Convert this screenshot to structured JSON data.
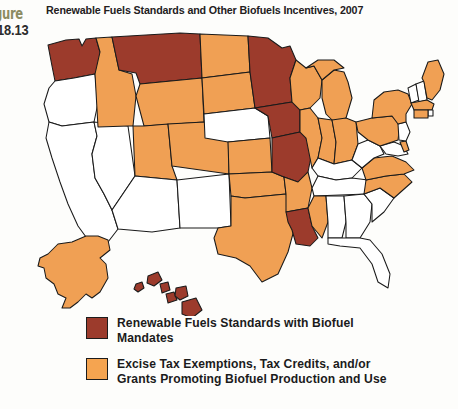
{
  "figure": {
    "label_word": "gure",
    "label_number": "18.13",
    "title": "Renewable Fuels Standards and Other Biofuels Incentives, 2007"
  },
  "colors": {
    "mandate_red": "#9c3b2c",
    "incentive_orange": "#f0a054",
    "no_policy_white": "#ffffff",
    "border": "#1a1a1a",
    "figure_tag": "#8c8c62",
    "background": "#fdfdfb"
  },
  "legend": {
    "items": [
      {
        "swatch": "mandate-red-swatch",
        "color": "#9c3b2c",
        "line1": "Renewable Fuels Standards with Biofuel",
        "line2": "Mandates"
      },
      {
        "swatch": "incentive-orange-swatch",
        "color": "#f5a450",
        "line1": "Excise Tax Exemptions, Tax Credits, and/or",
        "line2": "Grants Promoting Biofuel Production and Use"
      }
    ]
  },
  "map": {
    "type": "choropleth",
    "region": "United States",
    "categories": [
      "Renewable Fuels Standards with Biofuel Mandates",
      "Excise Tax Exemptions, Tax Credits, and/or Grants Promoting Biofuel Production and Use",
      "No listed program"
    ],
    "states": [
      {
        "code": "WA",
        "name": "Washington",
        "category": "mandate"
      },
      {
        "code": "OR",
        "name": "Oregon",
        "category": "none"
      },
      {
        "code": "CA",
        "name": "California",
        "category": "none"
      },
      {
        "code": "NV",
        "name": "Nevada",
        "category": "none"
      },
      {
        "code": "ID",
        "name": "Idaho",
        "category": "incentive"
      },
      {
        "code": "MT",
        "name": "Montana",
        "category": "mandate"
      },
      {
        "code": "WY",
        "name": "Wyoming",
        "category": "incentive"
      },
      {
        "code": "UT",
        "name": "Utah",
        "category": "incentive"
      },
      {
        "code": "AZ",
        "name": "Arizona",
        "category": "none"
      },
      {
        "code": "CO",
        "name": "Colorado",
        "category": "incentive"
      },
      {
        "code": "NM",
        "name": "New Mexico",
        "category": "none"
      },
      {
        "code": "ND",
        "name": "North Dakota",
        "category": "incentive"
      },
      {
        "code": "SD",
        "name": "South Dakota",
        "category": "incentive"
      },
      {
        "code": "NE",
        "name": "Nebraska",
        "category": "none"
      },
      {
        "code": "KS",
        "name": "Kansas",
        "category": "incentive"
      },
      {
        "code": "OK",
        "name": "Oklahoma",
        "category": "incentive"
      },
      {
        "code": "TX",
        "name": "Texas",
        "category": "incentive"
      },
      {
        "code": "MN",
        "name": "Minnesota",
        "category": "mandate"
      },
      {
        "code": "IA",
        "name": "Iowa",
        "category": "mandate"
      },
      {
        "code": "MO",
        "name": "Missouri",
        "category": "mandate"
      },
      {
        "code": "AR",
        "name": "Arkansas",
        "category": "incentive"
      },
      {
        "code": "LA",
        "name": "Louisiana",
        "category": "mandate"
      },
      {
        "code": "WI",
        "name": "Wisconsin",
        "category": "incentive"
      },
      {
        "code": "IL",
        "name": "Illinois",
        "category": "incentive"
      },
      {
        "code": "MI",
        "name": "Michigan",
        "category": "incentive"
      },
      {
        "code": "IN",
        "name": "Indiana",
        "category": "incentive"
      },
      {
        "code": "OH",
        "name": "Ohio",
        "category": "incentive"
      },
      {
        "code": "KY",
        "name": "Kentucky",
        "category": "none"
      },
      {
        "code": "TN",
        "name": "Tennessee",
        "category": "none"
      },
      {
        "code": "MS",
        "name": "Mississippi",
        "category": "incentive"
      },
      {
        "code": "AL",
        "name": "Alabama",
        "category": "none"
      },
      {
        "code": "GA",
        "name": "Georgia",
        "category": "none"
      },
      {
        "code": "FL",
        "name": "Florida",
        "category": "none"
      },
      {
        "code": "SC",
        "name": "South Carolina",
        "category": "none"
      },
      {
        "code": "NC",
        "name": "North Carolina",
        "category": "incentive"
      },
      {
        "code": "VA",
        "name": "Virginia",
        "category": "incentive"
      },
      {
        "code": "WV",
        "name": "West Virginia",
        "category": "none"
      },
      {
        "code": "MD",
        "name": "Maryland",
        "category": "none"
      },
      {
        "code": "DE",
        "name": "Delaware",
        "category": "incentive"
      },
      {
        "code": "PA",
        "name": "Pennsylvania",
        "category": "incentive"
      },
      {
        "code": "NJ",
        "name": "New Jersey",
        "category": "none"
      },
      {
        "code": "NY",
        "name": "New York",
        "category": "incentive"
      },
      {
        "code": "CT",
        "name": "Connecticut",
        "category": "incentive"
      },
      {
        "code": "RI",
        "name": "Rhode Island",
        "category": "none"
      },
      {
        "code": "MA",
        "name": "Massachusetts",
        "category": "incentive"
      },
      {
        "code": "VT",
        "name": "Vermont",
        "category": "none"
      },
      {
        "code": "NH",
        "name": "New Hampshire",
        "category": "none"
      },
      {
        "code": "ME",
        "name": "Maine",
        "category": "incentive"
      },
      {
        "code": "AK",
        "name": "Alaska",
        "category": "incentive"
      },
      {
        "code": "HI",
        "name": "Hawaii",
        "category": "mandate"
      }
    ]
  }
}
